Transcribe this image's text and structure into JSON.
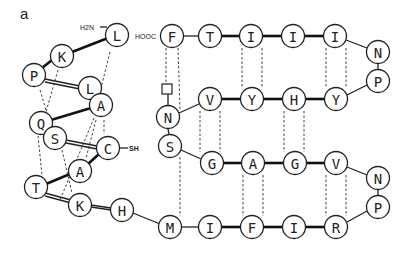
{
  "panel_label": "a",
  "left_helix": {
    "n_terminus": "H2N",
    "c_terminus": "SH",
    "residues": [
      {
        "id": "L1",
        "aa": "L",
        "x": 117,
        "y": 35
      },
      {
        "id": "K2",
        "aa": "K",
        "x": 62,
        "y": 56
      },
      {
        "id": "P3",
        "aa": "P",
        "x": 34,
        "y": 75
      },
      {
        "id": "L4",
        "aa": "L",
        "x": 90,
        "y": 88
      },
      {
        "id": "A5",
        "aa": "A",
        "x": 101,
        "y": 105
      },
      {
        "id": "Q6",
        "aa": "Q",
        "x": 41,
        "y": 123
      },
      {
        "id": "S7",
        "aa": "S",
        "x": 55,
        "y": 138
      },
      {
        "id": "C8",
        "aa": "C",
        "x": 108,
        "y": 148
      },
      {
        "id": "A9",
        "aa": "A",
        "x": 80,
        "y": 171
      },
      {
        "id": "T10",
        "aa": "T",
        "x": 36,
        "y": 187
      },
      {
        "id": "K11",
        "aa": "K",
        "x": 80,
        "y": 205
      },
      {
        "id": "H12",
        "aa": "H",
        "x": 122,
        "y": 210
      }
    ]
  },
  "beta_sheet": {
    "c_terminus": "HOOC",
    "strand1": [
      {
        "aa": "F",
        "x": 172,
        "y": 36
      },
      {
        "aa": "T",
        "x": 210,
        "y": 36
      },
      {
        "aa": "I",
        "x": 251,
        "y": 36
      },
      {
        "aa": "I",
        "x": 293,
        "y": 36
      },
      {
        "aa": "I",
        "x": 335,
        "y": 36
      }
    ],
    "turn1": [
      {
        "aa": "N",
        "x": 378,
        "y": 52
      },
      {
        "aa": "P",
        "x": 378,
        "y": 81
      }
    ],
    "strand2": [
      {
        "aa": "N",
        "x": 168,
        "y": 117
      },
      {
        "aa": "V",
        "x": 210,
        "y": 99
      },
      {
        "aa": "Y",
        "x": 252,
        "y": 99
      },
      {
        "aa": "H",
        "x": 294,
        "y": 99
      },
      {
        "aa": "Y",
        "x": 336,
        "y": 99
      }
    ],
    "strand3": [
      {
        "aa": "S",
        "x": 170,
        "y": 146
      },
      {
        "aa": "G",
        "x": 212,
        "y": 163
      },
      {
        "aa": "A",
        "x": 253,
        "y": 163
      },
      {
        "aa": "G",
        "x": 295,
        "y": 163
      },
      {
        "aa": "V",
        "x": 336,
        "y": 163
      }
    ],
    "turn2": [
      {
        "aa": "N",
        "x": 378,
        "y": 178
      },
      {
        "aa": "P",
        "x": 378,
        "y": 207
      }
    ],
    "strand4": [
      {
        "aa": "M",
        "x": 170,
        "y": 227
      },
      {
        "aa": "I",
        "x": 210,
        "y": 227
      },
      {
        "aa": "F",
        "x": 252,
        "y": 227
      },
      {
        "aa": "I",
        "x": 294,
        "y": 227
      },
      {
        "aa": "R",
        "x": 336,
        "y": 227
      }
    ]
  }
}
